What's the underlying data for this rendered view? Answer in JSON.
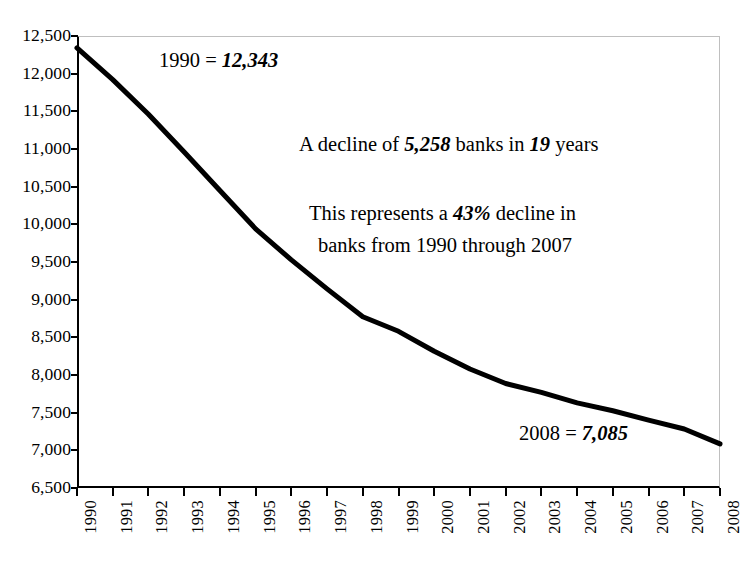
{
  "chart_data": {
    "type": "line",
    "title": "",
    "subtitle": "",
    "xlabel": "",
    "ylabel": "",
    "grid": false,
    "legend": "none",
    "categories": [
      "1990",
      "1991",
      "1992",
      "1993",
      "1994",
      "1995",
      "1996",
      "1997",
      "1998",
      "1999",
      "2000",
      "2001",
      "2002",
      "2003",
      "2004",
      "2005",
      "2006",
      "2007",
      "2008"
    ],
    "values": [
      12343,
      11921,
      11462,
      10960,
      10450,
      9940,
      9528,
      9143,
      8774,
      8580,
      8315,
      8080,
      7887,
      7770,
      7630,
      7526,
      7402,
      7283,
      7085
    ],
    "ylim": [
      6500,
      12500
    ],
    "ytick_values": [
      6500,
      7000,
      7500,
      8000,
      8500,
      9000,
      9500,
      10000,
      10500,
      11000,
      11500,
      12000,
      12500
    ],
    "ytick_labels": [
      "6,500",
      "7,000",
      "7,500",
      "8,000",
      "8,500",
      "9,000",
      "9,500",
      "10,000",
      "10,500",
      "11,000",
      "11,500",
      "12,000",
      "12,500"
    ],
    "xtick_labels": [
      "1990",
      "1991",
      "1992",
      "1993",
      "1994",
      "1995",
      "1996",
      "1997",
      "1998",
      "1999",
      "2000",
      "2001",
      "2002",
      "2003",
      "2004",
      "2005",
      "2006",
      "2007",
      "2008"
    ],
    "line_color": "#000000",
    "line_width": 5,
    "frame_color": "#bfbfbf",
    "axis_color": "#000000"
  },
  "annotations": {
    "start": {
      "prefix": "1990 = ",
      "value": "12,343"
    },
    "decline": {
      "prefix": "A decline of ",
      "value": "5,258",
      "middle": " banks in ",
      "value2": "19",
      "suffix": " years"
    },
    "percent": {
      "line1_prefix": "This represents a ",
      "line1_value": "43%",
      "line1_suffix": " decline in",
      "line2": "banks from 1990 through 2007"
    },
    "end": {
      "prefix": "2008 = ",
      "value": "7,085"
    }
  }
}
